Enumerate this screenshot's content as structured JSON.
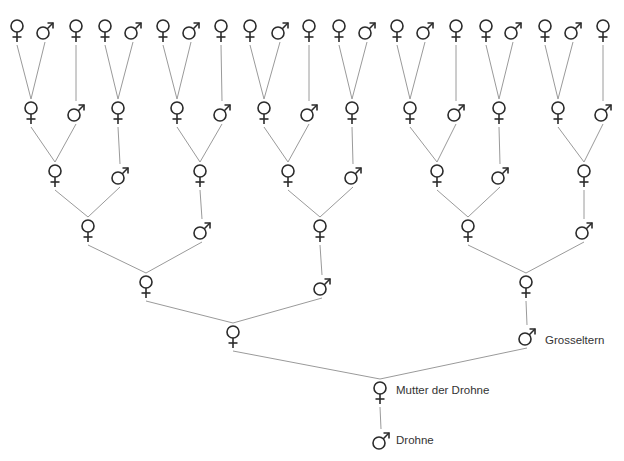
{
  "diagram": {
    "title": "",
    "type": "bee drone genealogy (Fibonacci ancestry)",
    "colors": {
      "line": "#9a9a9a",
      "symbol": "#2b2b2b",
      "label": "#333333",
      "background": "#ffffff"
    },
    "labels": {
      "grandparents": "Grosseltern",
      "mother": "Mutter der Drohne",
      "drone": "Drohne"
    },
    "rows": [
      {
        "y": 30,
        "nodes": [
          [
            "f",
            17
          ],
          [
            "m",
            45
          ],
          [
            "f",
            76
          ],
          [
            "f",
            105
          ],
          [
            "m",
            133
          ],
          [
            "f",
            163
          ],
          [
            "m",
            191
          ],
          [
            "f",
            221
          ],
          [
            "f",
            250
          ],
          [
            "m",
            280
          ],
          [
            "f",
            309
          ],
          [
            "f",
            339
          ],
          [
            "m",
            367
          ],
          [
            "f",
            397
          ],
          [
            "m",
            425
          ],
          [
            "f",
            456
          ],
          [
            "f",
            486
          ],
          [
            "m",
            513
          ],
          [
            "f",
            545
          ],
          [
            "m",
            573
          ],
          [
            "f",
            603
          ]
        ]
      },
      {
        "y": 112,
        "nodes": [
          [
            "f",
            31
          ],
          [
            "m",
            76
          ],
          [
            "f",
            118
          ],
          [
            "f",
            177
          ],
          [
            "m",
            222
          ],
          [
            "f",
            264
          ],
          [
            "m",
            309
          ],
          [
            "f",
            352
          ],
          [
            "f",
            410
          ],
          [
            "m",
            456
          ],
          [
            "f",
            499
          ],
          [
            "f",
            558
          ],
          [
            "m",
            603
          ]
        ]
      },
      {
        "y": 175,
        "nodes": [
          [
            "f",
            55
          ],
          [
            "m",
            120
          ],
          [
            "f",
            200
          ],
          [
            "f",
            288
          ],
          [
            "m",
            353
          ],
          [
            "f",
            437
          ],
          [
            "m",
            500
          ],
          [
            "f",
            584
          ]
        ]
      },
      {
        "y": 230,
        "nodes": [
          [
            "f",
            88
          ],
          [
            "m",
            202
          ],
          [
            "f",
            320
          ],
          [
            "f",
            468
          ],
          [
            "m",
            584
          ]
        ]
      },
      {
        "y": 286,
        "nodes": [
          [
            "f",
            146
          ],
          [
            "m",
            322
          ],
          [
            "f",
            526
          ]
        ]
      },
      {
        "y": 336,
        "nodes": [
          [
            "f",
            233
          ],
          [
            "m",
            527
          ]
        ]
      },
      {
        "y": 392,
        "nodes": [
          [
            "f",
            380
          ]
        ]
      },
      {
        "y": 440,
        "nodes": [
          [
            "m",
            381
          ]
        ]
      }
    ],
    "edges": [
      [
        0,
        0,
        1,
        0
      ],
      [
        0,
        1,
        1,
        0
      ],
      [
        0,
        2,
        1,
        1
      ],
      [
        0,
        3,
        1,
        2
      ],
      [
        0,
        4,
        1,
        2
      ],
      [
        0,
        5,
        1,
        3
      ],
      [
        0,
        6,
        1,
        3
      ],
      [
        0,
        7,
        1,
        4
      ],
      [
        0,
        8,
        1,
        5
      ],
      [
        0,
        9,
        1,
        5
      ],
      [
        0,
        10,
        1,
        6
      ],
      [
        0,
        11,
        1,
        7
      ],
      [
        0,
        12,
        1,
        7
      ],
      [
        0,
        13,
        1,
        8
      ],
      [
        0,
        14,
        1,
        8
      ],
      [
        0,
        15,
        1,
        9
      ],
      [
        0,
        16,
        1,
        10
      ],
      [
        0,
        17,
        1,
        10
      ],
      [
        0,
        18,
        1,
        11
      ],
      [
        0,
        19,
        1,
        11
      ],
      [
        0,
        20,
        1,
        12
      ],
      [
        1,
        0,
        2,
        0
      ],
      [
        1,
        1,
        2,
        0
      ],
      [
        1,
        2,
        2,
        1
      ],
      [
        1,
        3,
        2,
        2
      ],
      [
        1,
        4,
        2,
        2
      ],
      [
        1,
        5,
        2,
        3
      ],
      [
        1,
        6,
        2,
        3
      ],
      [
        1,
        7,
        2,
        4
      ],
      [
        1,
        8,
        2,
        5
      ],
      [
        1,
        9,
        2,
        5
      ],
      [
        1,
        10,
        2,
        6
      ],
      [
        1,
        11,
        2,
        7
      ],
      [
        1,
        12,
        2,
        7
      ],
      [
        2,
        0,
        3,
        0
      ],
      [
        2,
        1,
        3,
        0
      ],
      [
        2,
        2,
        3,
        1
      ],
      [
        2,
        3,
        3,
        2
      ],
      [
        2,
        4,
        3,
        2
      ],
      [
        2,
        5,
        3,
        3
      ],
      [
        2,
        6,
        3,
        3
      ],
      [
        2,
        7,
        3,
        4
      ],
      [
        3,
        0,
        4,
        0
      ],
      [
        3,
        1,
        4,
        0
      ],
      [
        3,
        2,
        4,
        1
      ],
      [
        3,
        3,
        4,
        2
      ],
      [
        3,
        4,
        4,
        2
      ],
      [
        4,
        0,
        5,
        0
      ],
      [
        4,
        1,
        5,
        0
      ],
      [
        4,
        2,
        5,
        1
      ],
      [
        5,
        0,
        6,
        0
      ],
      [
        5,
        1,
        6,
        0
      ],
      [
        6,
        0,
        7,
        0
      ]
    ],
    "row_counts": [
      21,
      13,
      8,
      5,
      3,
      2,
      1,
      1
    ]
  }
}
